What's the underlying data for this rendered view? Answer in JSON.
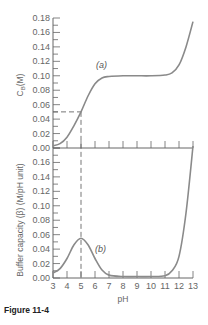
{
  "figure": {
    "caption": "Figure 11-4"
  },
  "chart_data": [
    {
      "type": "line",
      "panel": "upper",
      "title": "",
      "xlabel": "pH",
      "ylabel": "C_B (M)",
      "xlim": [
        3,
        13
      ],
      "ylim": [
        0.0,
        0.18
      ],
      "x_ticks": [
        3,
        4,
        5,
        6,
        7,
        8,
        9,
        10,
        11,
        12,
        13
      ],
      "y_ticks": [
        "0.00",
        "0.02",
        "0.04",
        "0.06",
        "0.08",
        "0.10",
        "0.12",
        "0.14",
        "0.16",
        "0.18"
      ],
      "grid": false,
      "annotations": [
        {
          "text": "(a)",
          "x": 6.3,
          "y": 0.115
        },
        {
          "type": "dashed-guide",
          "x": 5.0,
          "y": 0.05
        }
      ],
      "series": [
        {
          "name": "(a)",
          "x": [
            3.0,
            3.5,
            4.0,
            4.5,
            5.0,
            5.5,
            6.0,
            6.5,
            7.0,
            8.0,
            9.0,
            10.0,
            11.0,
            11.5,
            12.0,
            12.5,
            13.0
          ],
          "values": [
            0.003,
            0.006,
            0.015,
            0.031,
            0.05,
            0.072,
            0.089,
            0.097,
            0.099,
            0.1,
            0.1,
            0.1,
            0.101,
            0.104,
            0.115,
            0.14,
            0.175
          ]
        }
      ]
    },
    {
      "type": "line",
      "panel": "lower",
      "title": "",
      "xlabel": "pH",
      "ylabel": "Buffer capacity (β) (M/pH unit)",
      "xlim": [
        3,
        13
      ],
      "ylim": [
        0.0,
        0.18
      ],
      "x_ticks": [
        3,
        4,
        5,
        6,
        7,
        8,
        9,
        10,
        11,
        12,
        13
      ],
      "y_ticks": [
        "0.00",
        "0.02",
        "0.04",
        "0.06",
        "0.08",
        "0.10",
        "0.12",
        "0.14",
        "0.16",
        "0.18"
      ],
      "grid": false,
      "annotations": [
        {
          "text": "(b)",
          "x": 6.1,
          "y": 0.035
        },
        {
          "type": "dashed-guide",
          "x": 5.0
        }
      ],
      "series": [
        {
          "name": "(b)",
          "x": [
            3.0,
            3.5,
            4.0,
            4.5,
            5.0,
            5.5,
            6.0,
            6.5,
            7.0,
            8.0,
            9.0,
            10.0,
            11.0,
            11.5,
            12.0,
            12.5,
            13.0
          ],
          "values": [
            0.007,
            0.013,
            0.027,
            0.046,
            0.055,
            0.046,
            0.027,
            0.011,
            0.004,
            0.002,
            0.002,
            0.002,
            0.003,
            0.01,
            0.03,
            0.09,
            0.185
          ]
        }
      ]
    }
  ],
  "labels": {
    "upper_ylabel": "C_B (M)",
    "lower_ylabel": "Buffer capacity (β) (M/pH unit)",
    "xlabel": "pH",
    "curve_a": "(a)",
    "curve_b": "(b)"
  }
}
